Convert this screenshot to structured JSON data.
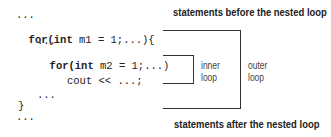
{
  "code": {
    "lines": [
      {
        "text": "...",
        "bold": false
      },
      {
        "kw": "for(int",
        "rest": " m1 = 1;...){"
      },
      {
        "text": "...",
        "bold": false
      },
      {
        "kw": "for(int",
        "rest": " m2 = 1;...)"
      },
      {
        "text": "cout << ...;",
        "bold": false
      },
      {
        "text": "...",
        "bold": false
      },
      {
        "text": "}",
        "bold": false
      },
      {
        "text": "...",
        "bold": false
      }
    ]
  },
  "annotations": {
    "top_label": "statements before the nested loop",
    "bottom_label": "statements after the nested loop",
    "inner_label_line1": "inner",
    "inner_label_line2": "loop",
    "outer_label_line1": "outer",
    "outer_label_line2": "loop"
  },
  "colors": {
    "text": "#222222",
    "lines": "#333333",
    "background": "#ffffff"
  }
}
